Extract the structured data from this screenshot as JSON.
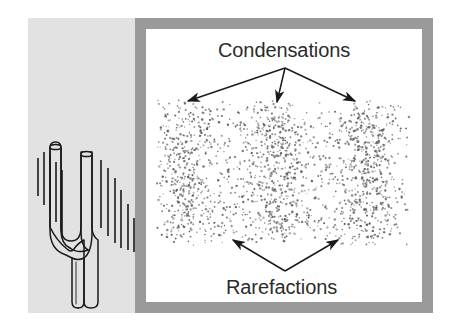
{
  "figure": {
    "width": 453,
    "height": 335,
    "background_color": "#ffffff"
  },
  "left_panel": {
    "name": "tuning-fork-panel",
    "background_color": "#e2e2e2",
    "x": 28,
    "y": 18,
    "width": 114,
    "height": 295,
    "source": {
      "name": "tuning-fork",
      "description": "Two-pronged tuning fork drawn in line art, stem pointing down",
      "outline_color": "#1a1a1a",
      "fill_color": "#e2e2e2",
      "prong_left_x": 68,
      "prong_right_x": 94,
      "prong_top_y": 148,
      "fork_base_y": 236,
      "stem_bottom_y": 302
    },
    "vibration_lines": {
      "name": "vibration-lines",
      "color": "#1a1a1a",
      "left_group": [
        {
          "x": 38,
          "y1": 158,
          "y2": 196
        },
        {
          "x": 44,
          "y1": 152,
          "y2": 205
        },
        {
          "x": 50,
          "y1": 155,
          "y2": 212
        },
        {
          "x": 56,
          "y1": 162,
          "y2": 222
        },
        {
          "x": 62,
          "y1": 170,
          "y2": 235
        }
      ],
      "right_group": [
        {
          "x": 101,
          "y1": 160,
          "y2": 228
        },
        {
          "x": 108,
          "y1": 168,
          "y2": 236
        },
        {
          "x": 115,
          "y1": 178,
          "y2": 243
        },
        {
          "x": 121,
          "y1": 190,
          "y2": 248
        },
        {
          "x": 128,
          "y1": 204,
          "y2": 250
        },
        {
          "x": 134,
          "y1": 218,
          "y2": 252
        }
      ]
    }
  },
  "frame": {
    "name": "picture-frame",
    "border_color": "#9a9a9a",
    "border_width": 11,
    "inner_background": "#ffffff",
    "x": 135,
    "y": 18,
    "width": 298,
    "height": 295
  },
  "labels": {
    "condensations": "Condensations",
    "rarefactions": "Rarefactions",
    "text_color": "#2b2b2b",
    "font_size_px": 20
  },
  "arrows": {
    "color": "#1a1a1a",
    "condensation_arrows": {
      "name": "condensation-arrows",
      "origin": {
        "x": 285,
        "y": 68
      },
      "tips": [
        {
          "x": 188,
          "y": 101,
          "target": "left-condensation-band"
        },
        {
          "x": 277,
          "y": 102,
          "target": "center-condensation-band"
        },
        {
          "x": 355,
          "y": 101,
          "target": "right-condensation-band"
        }
      ]
    },
    "rarefaction_arrows": {
      "name": "rarefaction-arrows",
      "origin": {
        "x": 285,
        "y": 271
      },
      "tips": [
        {
          "x": 233,
          "y": 240,
          "target": "left-rarefaction-gap"
        },
        {
          "x": 338,
          "y": 240,
          "target": "right-rarefaction-gap"
        }
      ]
    }
  },
  "chart_data": {
    "type": "scatter",
    "xlabel": "",
    "ylabel": "",
    "field": {
      "x": 163,
      "y": 104,
      "width": 240,
      "height": 138
    },
    "dot_color": "#5a5a5a",
    "dot_radius_px": 0.9,
    "total_dots": 1850,
    "categories": [
      "left-condensation",
      "left-rarefaction",
      "center-condensation",
      "right-rarefaction",
      "right-condensation"
    ],
    "band_centers_x": [
      186,
      232,
      277,
      325,
      368
    ],
    "band_half_width_x": [
      26,
      22,
      28,
      22,
      28
    ],
    "values": [
      1.0,
      0.18,
      1.0,
      0.18,
      1.0
    ],
    "ylim": [
      0,
      1
    ],
    "grid": false,
    "legend": false,
    "density_profile_note": "Relative molecule density: peaks at condensations (1.0), troughs at rarefactions (0.18)"
  }
}
